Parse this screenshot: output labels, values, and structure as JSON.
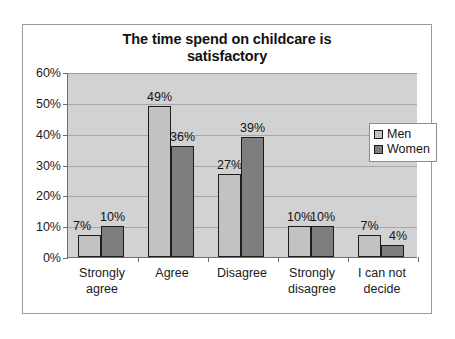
{
  "chart_data": {
    "type": "bar",
    "title": "The time spend on childcare is satisfactory",
    "title_line1": "The time spend on childcare is",
    "title_line2": "satisfactory",
    "xlabel": "",
    "ylabel": "",
    "ylim": [
      0,
      60
    ],
    "ytick_labels": [
      "0%",
      "10%",
      "20%",
      "30%",
      "40%",
      "50%",
      "60%"
    ],
    "ytick_values": [
      0,
      10,
      20,
      30,
      40,
      50,
      60
    ],
    "grid": true,
    "legend_position": "right",
    "categories": [
      "Strongly agree",
      "Agree",
      "Disagree",
      "Strongly disagree",
      "I can not decide"
    ],
    "category_lines": [
      [
        "Strongly",
        "agree"
      ],
      [
        "Agree",
        ""
      ],
      [
        "Disagree",
        ""
      ],
      [
        "Strongly",
        "disagree"
      ],
      [
        "I can not",
        "decide"
      ]
    ],
    "series": [
      {
        "name": "Men",
        "color": "#c2c2c2",
        "values": [
          7,
          49,
          27,
          10,
          7
        ],
        "labels": [
          "7%",
          "49%",
          "27%",
          "10%",
          "7%"
        ]
      },
      {
        "name": "Women",
        "color": "#7e7e7e",
        "values": [
          10,
          36,
          39,
          10,
          4
        ],
        "labels": [
          "10%",
          "36%",
          "39%",
          "10%",
          "4%"
        ]
      }
    ]
  },
  "legend": {
    "items": [
      {
        "label": "Men"
      },
      {
        "label": "Women"
      }
    ]
  },
  "colors": {
    "men_bar": "#c2c2c2",
    "women_bar": "#7e7e7e",
    "plot_background": "#d2d2d2",
    "frame_border": "#9a9a9a",
    "axis": "#6d6d6d"
  }
}
